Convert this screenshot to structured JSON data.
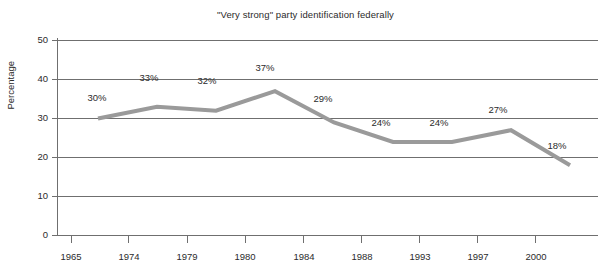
{
  "chart_data": {
    "type": "line",
    "title": "\"Very strong\" party identification federally",
    "xlabel": "",
    "ylabel": "Percentage",
    "categories": [
      "1965",
      "1974",
      "1979",
      "1980",
      "1984",
      "1988",
      "1993",
      "1997",
      "2000"
    ],
    "values": [
      30,
      33,
      32,
      37,
      29,
      24,
      24,
      27,
      18
    ],
    "point_labels": [
      "30%",
      "33%",
      "32%",
      "37%",
      "29%",
      "24%",
      "24%",
      "27%",
      "18%"
    ],
    "ylim": [
      0,
      50
    ],
    "y_ticks": [
      "0",
      "10",
      "20",
      "30",
      "40",
      "50"
    ],
    "grid": true,
    "legend": "none",
    "series_color": "#9a9a9a",
    "axis_color": "#6f6f6f",
    "grid_color": "#6f6f6f",
    "text_color": "#2b2b2b"
  }
}
